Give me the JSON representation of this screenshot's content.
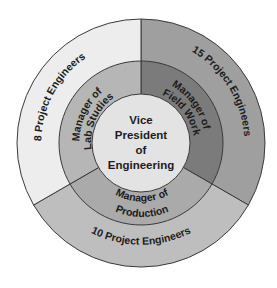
{
  "diagram": {
    "type": "concentric-org-chart",
    "center": {
      "label_lines": [
        "Vice",
        "President",
        "of",
        "Engineering"
      ],
      "color": "#e3e3e3"
    },
    "managers": [
      {
        "label_lines": [
          "Manager of",
          "Lab Studies"
        ],
        "color": "#b6b6b6",
        "engineers": {
          "label": "8 Project Engineers",
          "count": 8,
          "color": "#ededed"
        }
      },
      {
        "label_lines": [
          "Manager of",
          "Field Work"
        ],
        "color": "#7b7b7b",
        "engineers": {
          "label": "15 Project Engineers",
          "count": 15,
          "color": "#9f9f9f"
        }
      },
      {
        "label_lines": [
          "Manager of",
          "Production"
        ],
        "color": "#aaaaaa",
        "engineers": {
          "label": "10 Project Engineers",
          "count": 10,
          "color": "#bebebe"
        }
      }
    ],
    "stroke_color": "#3a3a3a"
  }
}
